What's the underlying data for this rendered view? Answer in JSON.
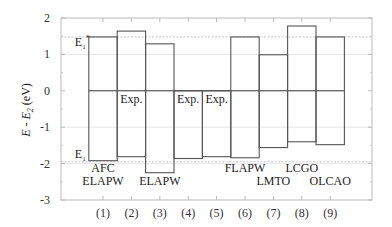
{
  "chart_data": {
    "type": "bar",
    "title": "",
    "xlabel": "",
    "ylabel": "E - E_2 (eV)",
    "ylim": [
      -3,
      2
    ],
    "yticks": [
      2,
      1,
      0,
      -1,
      -2,
      -3
    ],
    "grid": true,
    "categories": [
      "(1)",
      "(2)",
      "(3)",
      "(4)",
      "(5)",
      "(6)",
      "(7)",
      "(8)",
      "(9)"
    ],
    "series": [
      {
        "name": "E1* (upper edge)",
        "values": [
          1.48,
          1.64,
          1.29,
          0.0,
          0.0,
          1.48,
          0.99,
          1.78,
          1.48
        ]
      },
      {
        "name": "E1 (lower edge)",
        "values": [
          -1.92,
          -1.81,
          -2.25,
          -1.86,
          -1.81,
          -1.84,
          -1.56,
          -1.4,
          -1.48
        ]
      }
    ],
    "reference_lines": [
      {
        "label": "E1*",
        "y": 1.48,
        "style": "dashed"
      },
      {
        "label": "E1",
        "y": -1.95,
        "style": "dashed"
      },
      {
        "label": "zero",
        "y": 0,
        "style": "solid"
      }
    ],
    "annotations": [
      {
        "text": "E1*",
        "category": "(1)",
        "position": "left-of-bar-top"
      },
      {
        "text": "E1",
        "category": "(1)",
        "position": "left-of-bar-bottom"
      },
      {
        "text": "AFC",
        "category": "(1)",
        "line": 1
      },
      {
        "text": "ELAPW",
        "category": "(1)",
        "line": 2
      },
      {
        "text": "Exp.",
        "category": "(2)"
      },
      {
        "text": "ELAPW",
        "category": "(3)"
      },
      {
        "text": "Exp.",
        "category": "(4)"
      },
      {
        "text": "Exp.",
        "category": "(5)"
      },
      {
        "text": "FLAPW",
        "category": "(6)"
      },
      {
        "text": "LMTO",
        "category": "(7)"
      },
      {
        "text": "LCGO",
        "category": "(8)"
      },
      {
        "text": "OLCAO",
        "category": "(9)"
      }
    ]
  },
  "labels": {
    "ylabel_main": "E - E",
    "ylabel_sub": "2",
    "ylabel_unit": " (eV)",
    "e1star_main": "E",
    "e1star_sub": "1",
    "e1star_sup": "*",
    "e1_main": "E",
    "e1_sub": "1"
  }
}
